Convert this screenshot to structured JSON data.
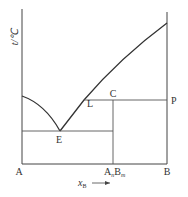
{
  "diagram": {
    "type": "phase-diagram",
    "y_axis_label": "t/℃",
    "x_axis_label_main": "x",
    "x_axis_label_sub": "B",
    "points": {
      "A": "A",
      "B": "B",
      "E": "E",
      "L": "L",
      "C": "C",
      "P": "P",
      "compound_main": "A",
      "compound_n": "n",
      "compound_B": "B",
      "compound_m": "m"
    },
    "line_color": "#333333"
  }
}
